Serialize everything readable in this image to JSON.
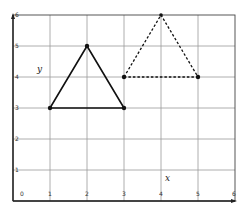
{
  "diagram": {
    "type": "coordinate-grid",
    "x_axis": {
      "label": "x",
      "ticks": [
        "0",
        "1",
        "2",
        "3",
        "4",
        "5",
        "6"
      ],
      "range": [
        0,
        6
      ]
    },
    "y_axis": {
      "label": "y",
      "ticks": [
        "1",
        "2",
        "3",
        "4",
        "5",
        "6"
      ],
      "range": [
        0,
        6
      ]
    },
    "shapes": [
      {
        "name": "solid-triangle",
        "style": "solid",
        "vertices": [
          [
            1,
            3
          ],
          [
            2,
            5
          ],
          [
            3,
            3
          ]
        ]
      },
      {
        "name": "dashed-triangle",
        "style": "dashed",
        "vertices": [
          [
            3,
            4
          ],
          [
            4,
            6
          ],
          [
            5,
            4
          ]
        ]
      }
    ],
    "colors": {
      "grid": "#999999",
      "axis": "#222222",
      "shape": "#111111"
    }
  }
}
